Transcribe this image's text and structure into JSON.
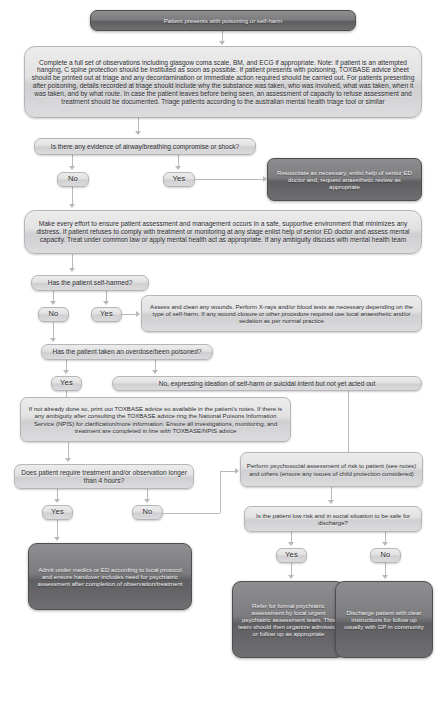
{
  "document": {
    "title": "Poisoning or self-harm emergency department pathway",
    "type": "clinical-flowchart",
    "background_color": "#ffffff",
    "node_dark_color": "#6f6f72",
    "node_light_color": "#e2e2e3",
    "connector_color": "#b9b9bc",
    "dark_text_color": "#2b2b2e",
    "light_text_color": "#f2f2f3"
  },
  "nodes": {
    "start": "Patient presents with poisoning or self-harm",
    "observations": "Complete a full set of observations including glasgow coma scale, BM, and ECG if appropriate. Note: if patient is an attempted hanging, C spine protection should be instituted as soon as possible. If patient presents with poisoning, TOXBASE advice sheet should be printed out at triage and any decontamination or immediate action required should be carried out. For patients presenting after poisoning, details recorded at triage should include why the substance was taken, who was involved, what was taken, when it was taken, and by what route. In case the patient leaves before being seen, an assessment of capacity to refuse assessment and treatment should be documented. Triage patients according to the australian mental health triage tool or similar",
    "airway_question": "Is there any evidence of airway/breathing compromise or shock?",
    "airway_no": "No",
    "airway_yes": "Yes",
    "resuscitate": "Resuscitate as necessary, enlist help of senior ED doctor and, request anaesthetic review as appropriate",
    "environment": "Make every effort to ensure patient assessment and management occurs in a safe, supportive environment that minimizes any distress. If patient refuses to comply with treatment or monitoring at any stage enlist help of senior ED doctor and assess mental capacity. Treat under common law or apply mental health act as appropriate. If any ambiguity discuss with mental health team",
    "selfharm_question": "Has the patient self-harmed?",
    "selfharm_no": "No",
    "selfharm_yes": "Yes",
    "wounds": "Assess and clean any wounds. Perform X-rays and/or blood tests as necessary depending on the type of self-harm. If any wound closure or other procedure required use local anaesthetic and/or sedation as per normal practice",
    "overdose_question": "Has the patient taken an overdose/been poisoned?",
    "overdose_yes": "Yes",
    "overdose_no": "No, expressing ideation of self-harm or suicidal intent but not yet acted out",
    "toxbase": "If not already done so, print out TOXBASE advice so available in the patient's notes. If there is any ambiguity after consulting the TOXBASE advice ring the National Poisons Information Service (NPIS) for clarification/more information. Ensure all investigations, monitoring, and treatment are completed in line with TOXBASE/NPIS advice",
    "duration_question": "Does patient require treatment and/or observation longer than 4 hours?",
    "duration_yes": "Yes",
    "duration_no": "No",
    "psychosocial": "Perform psychosocial assessment of risk to patient (see notes) and others (ensure any issues of child protection considered)",
    "lowrisk_question": "Is the patient low risk and in social situation to be safe for discharge?",
    "lowrisk_yes": "Yes",
    "lowrisk_no": "No",
    "admit": "Admit under medics or ED according to local protocol and ensure handover includes need for psychiatric assessment after completion of observation/treatment",
    "refer": "Refer for formal psychiatric assessment by local urgent psychiatric assessment team. This team should then organize admission or follow up as appropriate",
    "discharge": "Discharge patient with clear instructions for follow up usually with GP in community"
  }
}
